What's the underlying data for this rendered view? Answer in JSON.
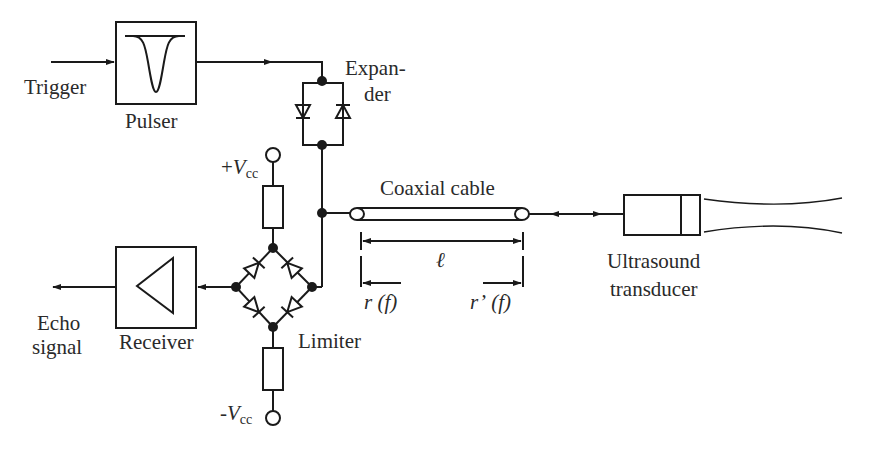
{
  "diagram": {
    "type": "ultrasound pulse-echo circuit block diagram",
    "blocks": {
      "pulser": {
        "label": "Pulser",
        "icon": "negative-pulse"
      },
      "receiver": {
        "label": "Receiver",
        "icon": "amplifier-triangle"
      },
      "transducer": {
        "label_line1": "Ultrasound",
        "label_line2": "transducer"
      }
    },
    "labels": {
      "trigger": "Trigger",
      "expander_line1": "Expan-",
      "expander_line2": "der",
      "coax": "Coaxial cable",
      "length": "ℓ",
      "r_left_sym": "r",
      "r_left_arg": "(f)",
      "r_right_sym": "r’",
      "r_right_arg": "(f)",
      "limiter": "Limiter",
      "echo_line1": "Echo",
      "echo_line2": "signal",
      "vcc_pos_sign": "+",
      "vcc_neg_sign": "-",
      "vcc_sym": "V",
      "vcc_sub": "cc"
    },
    "connections": [
      {
        "from": "Trigger",
        "to": "Pulser"
      },
      {
        "from": "Pulser",
        "to": "Expander"
      },
      {
        "from": "Expander",
        "to": "Coaxial cable"
      },
      {
        "from": "Coaxial cable",
        "to": "Ultrasound transducer",
        "bidirectional": true
      },
      {
        "from": "Limiter",
        "to": "Receiver"
      },
      {
        "from": "Receiver",
        "to": "Echo signal"
      }
    ],
    "colors": {
      "stroke": "#1a1a1a",
      "text": "#2a2a2a",
      "background": "#ffffff"
    }
  }
}
